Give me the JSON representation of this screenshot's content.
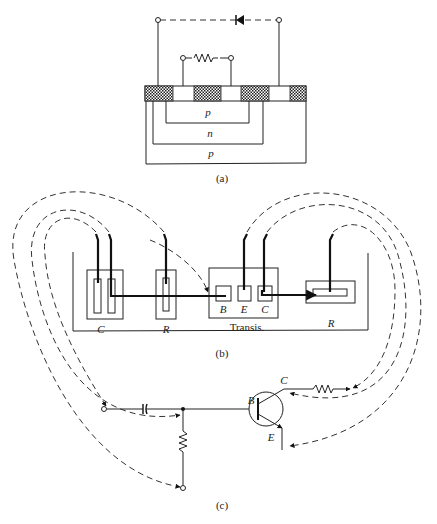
{
  "figure": {
    "panels": [
      {
        "id": "a",
        "caption": "(a)",
        "title": "Cross-section of integrated circuit showing isolation diode and diffused resistor",
        "regions": [
          {
            "label": "p",
            "kind": "inner-diffusion"
          },
          {
            "label": "n",
            "kind": "isolation-well"
          },
          {
            "label": "p",
            "kind": "substrate"
          }
        ],
        "components": [
          "diode",
          "resistor"
        ]
      },
      {
        "id": "b",
        "caption": "(b)",
        "elements": [
          {
            "label": "C",
            "kind": "capacitor"
          },
          {
            "label": "R",
            "kind": "resistor"
          },
          {
            "label": "Transis.",
            "kind": "transistor",
            "terminals": [
              "B",
              "E",
              "C"
            ]
          },
          {
            "label": "R",
            "kind": "resistor"
          }
        ]
      },
      {
        "id": "c",
        "caption": "(c)",
        "title": "Equivalent circuit",
        "transistor_terminals": {
          "base": "B",
          "collector": "C",
          "emitter": "E"
        },
        "components": [
          "capacitor",
          "resistor",
          "resistor",
          "npn-transistor"
        ]
      }
    ]
  },
  "labels": {
    "a_p_inner": "p",
    "a_n": "n",
    "a_p_outer": "p",
    "a_caption": "(a)",
    "b_cap": "C",
    "b_res1": "R",
    "b_base": "B",
    "b_emit": "E",
    "b_coll": "C",
    "b_transis": "Transis.",
    "b_res2": "R",
    "b_caption": "(b)",
    "c_base": "B",
    "c_coll": "C",
    "c_emit": "E",
    "c_caption": "(c)"
  },
  "colors": {
    "ink": "#222222",
    "background": "#ffffff"
  }
}
